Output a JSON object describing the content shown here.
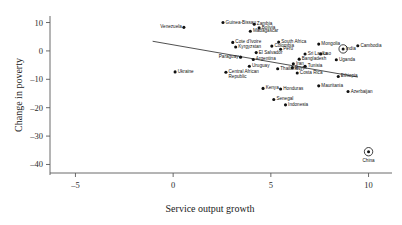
{
  "chart_data": {
    "type": "scatter",
    "title": "",
    "xlabel": "Service output growth",
    "ylabel": "Change in poverty",
    "xlim": [
      -6.2,
      11.2
    ],
    "ylim": [
      -43,
      13
    ],
    "xticks": [
      -5,
      0,
      5,
      10
    ],
    "xticklabels": [
      "–5",
      "0",
      "5",
      "10"
    ],
    "yticks": [
      10,
      0,
      -10,
      -20,
      -30,
      -40
    ],
    "yticklabels": [
      "10",
      "0",
      "–10",
      "–20",
      "–30",
      "–40"
    ],
    "grid": false,
    "legend": false,
    "trend_line": {
      "label": "fitted regression line",
      "x_start": -1.05,
      "y_start": 3.4,
      "x_end": 9.45,
      "y_end": -9.2
    },
    "points": [
      {
        "name": "Venezuela",
        "x": 0.55,
        "y": 8.3,
        "label_pos": "left",
        "highlight": false
      },
      {
        "name": "Guinea-Bissau",
        "x": 2.55,
        "y": 10.0,
        "label_pos": "right",
        "highlight": false
      },
      {
        "name": "Zambia",
        "x": 4.15,
        "y": 9.4,
        "label_pos": "right",
        "highlight": false
      },
      {
        "name": "Bolivia",
        "x": 4.4,
        "y": 8.1,
        "label_pos": "right",
        "highlight": false
      },
      {
        "name": "Madagascar",
        "x": 3.95,
        "y": 6.9,
        "label_pos": "right",
        "highlight": false
      },
      {
        "name": "Cote d'Ivoire",
        "x": 3.05,
        "y": 3.0,
        "label_pos": "right",
        "highlight": false
      },
      {
        "name": "South Africa",
        "x": 5.4,
        "y": 3.1,
        "label_pos": "right",
        "highlight": false
      },
      {
        "name": "Kyrgyzstan",
        "x": 3.2,
        "y": 1.4,
        "label_pos": "right",
        "highlight": false
      },
      {
        "name": "Colombia",
        "x": 5.05,
        "y": 1.7,
        "label_pos": "right",
        "highlight": false
      },
      {
        "name": "Peru",
        "x": 5.5,
        "y": 0.6,
        "label_pos": "right",
        "highlight": false
      },
      {
        "name": "El Salvador",
        "x": 4.25,
        "y": -0.6,
        "label_pos": "right",
        "highlight": false
      },
      {
        "name": "Paraguay",
        "x": 3.45,
        "y": -2.2,
        "label_pos": "left",
        "highlight": false
      },
      {
        "name": "Argentina",
        "x": 4.1,
        "y": -3.0,
        "label_pos": "right",
        "highlight": false
      },
      {
        "name": "Uruguay",
        "x": 3.9,
        "y": -5.4,
        "label_pos": "right",
        "highlight": false
      },
      {
        "name": "Thailand",
        "x": 5.35,
        "y": -6.3,
        "label_pos": "right",
        "highlight": false
      },
      {
        "name": "Sri Lanka",
        "x": 6.75,
        "y": -1.1,
        "label_pos": "right",
        "highlight": false
      },
      {
        "name": "Bangladesh",
        "x": 6.45,
        "y": -2.9,
        "label_pos": "right",
        "highlight": false
      },
      {
        "name": "Iran",
        "x": 6.15,
        "y": -4.5,
        "label_pos": "right",
        "highlight": false
      },
      {
        "name": "Egypt",
        "x": 6.1,
        "y": -5.9,
        "label_pos": "right",
        "highlight": false
      },
      {
        "name": "Tunisia",
        "x": 6.75,
        "y": -5.4,
        "label_pos": "right",
        "highlight": false
      },
      {
        "name": "Costa Rica",
        "x": 6.35,
        "y": -7.8,
        "label_pos": "right",
        "highlight": false
      },
      {
        "name": "Mongolia",
        "x": 7.45,
        "y": 2.4,
        "label_pos": "right",
        "highlight": false
      },
      {
        "name": "Cambodia",
        "x": 9.45,
        "y": 1.8,
        "label_pos": "right",
        "highlight": false
      },
      {
        "name": "India",
        "x": 8.7,
        "y": 0.7,
        "label_pos": "right",
        "highlight": true
      },
      {
        "name": "Lao",
        "x": 7.55,
        "y": -1.1,
        "label_pos": "right",
        "highlight": false
      },
      {
        "name": "Uganda",
        "x": 8.35,
        "y": -3.1,
        "label_pos": "right",
        "highlight": false
      },
      {
        "name": "Ethiopia",
        "x": 8.45,
        "y": -9.0,
        "label_pos": "right",
        "highlight": false
      },
      {
        "name": "Ukraine",
        "x": 0.1,
        "y": -7.4,
        "label_pos": "right",
        "highlight": false
      },
      {
        "name": "Central African Republic",
        "x": 2.7,
        "y": -7.5,
        "label_pos": "right",
        "highlight": false
      },
      {
        "name": "Kenya",
        "x": 4.6,
        "y": -13.2,
        "label_pos": "right",
        "highlight": false
      },
      {
        "name": "Honduras",
        "x": 5.5,
        "y": -13.4,
        "label_pos": "right",
        "highlight": false
      },
      {
        "name": "Mauritania",
        "x": 7.45,
        "y": -12.3,
        "label_pos": "right",
        "highlight": false
      },
      {
        "name": "Azerbaijan",
        "x": 8.95,
        "y": -14.3,
        "label_pos": "right",
        "highlight": false
      },
      {
        "name": "Senegal",
        "x": 5.15,
        "y": -17.1,
        "label_pos": "right",
        "highlight": false
      },
      {
        "name": "Indonesia",
        "x": 5.75,
        "y": -19.0,
        "label_pos": "right",
        "highlight": false
      },
      {
        "name": "China",
        "x": 10.0,
        "y": -35.5,
        "label_pos": "below",
        "highlight": true
      }
    ]
  }
}
